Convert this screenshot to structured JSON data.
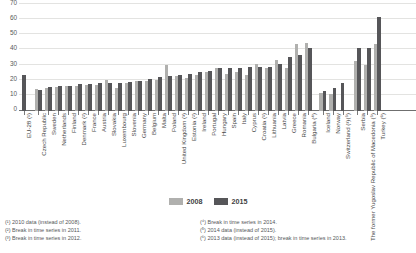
{
  "chart_data": {
    "type": "bar",
    "title": "",
    "xlabel": "",
    "ylabel": "",
    "ylim": [
      0,
      70
    ],
    "yticks": [
      70,
      60,
      50,
      40,
      30,
      20,
      10,
      0
    ],
    "grid": true,
    "legend_position": "bottom-center",
    "categories": [
      "EU-28 (¹)",
      "Czech Republic",
      "Sweden",
      "Netherlands",
      "Finland",
      "Denmark (²)",
      "France",
      "Austria",
      "Slovakia",
      "Luxembourg",
      "Slovenia",
      "Germany",
      "Belgium",
      "Malta",
      "Poland",
      "United Kingdom (³)",
      "Estonia (²)",
      "Ireland",
      "Portugal",
      "Hungary",
      "Spain",
      "Italy",
      "Cyprus",
      "Croatia (¹)",
      "Lithuania",
      "Latvia",
      "Greece",
      "Romania",
      "Bulgaria (⁴)",
      "Iceland",
      "Norway",
      "Switzerland (³)(⁵)",
      "Serbia",
      "The former Yugoslav Republic of Macedonia (⁵)",
      "Turkey (⁶)"
    ],
    "series": [
      {
        "name": "2008",
        "color": "#b0b0ae",
        "values": [
          null,
          14.5,
          15.0,
          15.6,
          16.8,
          16.5,
          17.5,
          17.4,
          20.5,
          15.5,
          18.5,
          20.1,
          20.0,
          20.3,
          30.5,
          23.2,
          22.0,
          23.5,
          26.0,
          28.5,
          24.5,
          25.5,
          23.5,
          31.0,
          28.5,
          34.0,
          28.1,
          44.2,
          44.8,
          11.8,
          11.0,
          null,
          33.0,
          30.5,
          44.5
        ]
      },
      {
        "name": "2015",
        "color": "#565659",
        "values": [
          23.7,
          14.0,
          16.0,
          16.4,
          16.8,
          17.7,
          17.7,
          18.3,
          18.4,
          18.5,
          19.2,
          20.0,
          21.1,
          22.4,
          23.4,
          23.5,
          24.2,
          26.0,
          26.6,
          28.2,
          28.6,
          28.7,
          28.9,
          29.1,
          29.3,
          30.9,
          35.7,
          37.3,
          41.3,
          13.4,
          14.9,
          18.2,
          41.3,
          41.6,
          62.0
        ]
      }
    ],
    "group_breaks_after": [
      "EU-28 (¹)",
      "Bulgaria (⁴)",
      "Switzerland (³)(⁵)"
    ]
  },
  "legend": {
    "items": [
      {
        "label": "2008",
        "color": "#b0b0ae"
      },
      {
        "label": "2015",
        "color": "#565659"
      }
    ]
  },
  "footnotes": {
    "left": [
      "(¹) 2010 data (instead of 2008).",
      "(²) Break in time series in 2011.",
      "(³) Break in time series in 2012."
    ],
    "right": [
      "(⁴) Break in time series in 2014.",
      "(⁵) 2014 data (instead of 2015).",
      "(⁶) 2013 data (instead of 2015); break in time series in 2013."
    ]
  }
}
